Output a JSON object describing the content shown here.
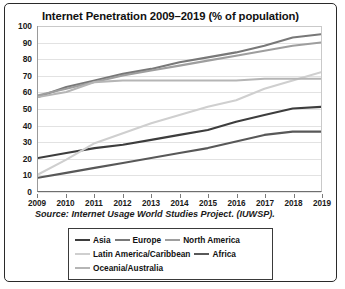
{
  "figure": {
    "title": "Internet Penetration 2009–2019 (% of population)",
    "source": "Source: Internet Usage World Studies Project. (IUWSP)."
  },
  "chart_data": {
    "type": "line",
    "title": "Internet Penetration 2009–2019 (% of population)",
    "xlabel": "",
    "ylabel": "",
    "xlim": [
      2009,
      2019
    ],
    "ylim": [
      0,
      100
    ],
    "grid": true,
    "legend_position": "bottom",
    "categories": [
      "2009",
      "2010",
      "2011",
      "2012",
      "2013",
      "2014",
      "2015",
      "2016",
      "2017",
      "2018",
      "2019"
    ],
    "x": [
      2009,
      2010,
      2011,
      2012,
      2013,
      2014,
      2015,
      2016,
      2017,
      2018,
      2019
    ],
    "yticks": [
      0,
      10,
      20,
      30,
      40,
      50,
      60,
      70,
      80,
      90,
      100
    ],
    "series": [
      {
        "name": "Asia",
        "color": "#3d3d3d",
        "values": [
          20,
          23,
          26,
          28,
          31,
          34,
          37,
          42,
          46,
          50,
          51
        ]
      },
      {
        "name": "Europe",
        "color": "#787878",
        "values": [
          57,
          63,
          67,
          71,
          74,
          78,
          81,
          84,
          88,
          93,
          95
        ]
      },
      {
        "name": "North America",
        "color": "#9e9e9e",
        "values": [
          58,
          62,
          66,
          70,
          73,
          76,
          79,
          82,
          85,
          88,
          90
        ]
      },
      {
        "name": "Latin America/Caribbean",
        "color": "#cfcfcf",
        "values": [
          10,
          19,
          29,
          35,
          41,
          46,
          51,
          55,
          62,
          67,
          72
        ]
      },
      {
        "name": "Africa",
        "color": "#585858",
        "values": [
          8,
          11,
          14,
          17,
          20,
          23,
          26,
          30,
          34,
          36,
          36
        ]
      },
      {
        "name": "Oceania/Australia",
        "color": "#b5b5b5",
        "values": [
          57,
          60,
          66,
          67,
          67,
          67,
          67,
          67,
          68,
          68,
          68
        ]
      }
    ]
  },
  "legend": {
    "rows": [
      [
        {
          "label": "Asia",
          "color": "#3d3d3d"
        },
        {
          "label": "Europe",
          "color": "#787878"
        },
        {
          "label": "North America",
          "color": "#9e9e9e"
        }
      ],
      [
        {
          "label": "Latin America/Caribbean",
          "color": "#cfcfcf"
        },
        {
          "label": "Africa",
          "color": "#585858"
        }
      ],
      [
        {
          "label": "Oceania/Australia",
          "color": "#b5b5b5"
        }
      ]
    ]
  }
}
